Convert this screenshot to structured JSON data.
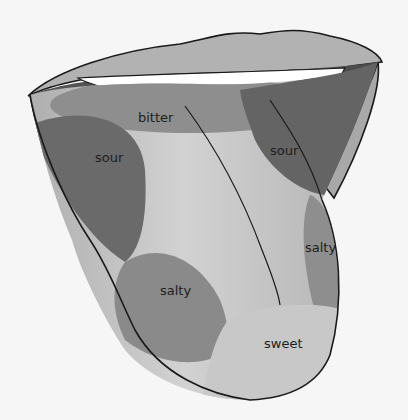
{
  "diagram": {
    "regions": [
      {
        "id": "bitter",
        "label": "bitter",
        "x": 160,
        "y": 118
      },
      {
        "id": "sour-left",
        "label": "sour",
        "x": 115,
        "y": 158
      },
      {
        "id": "sour-right",
        "label": "sour",
        "x": 284,
        "y": 155
      },
      {
        "id": "salty-right",
        "label": "salty",
        "x": 325,
        "y": 248
      },
      {
        "id": "salty-left",
        "label": "salty",
        "x": 180,
        "y": 292
      },
      {
        "id": "sweet",
        "label": "sweet",
        "x": 283,
        "y": 345
      }
    ],
    "colors": {
      "background": "#f6f6f6",
      "outline": "#1a1a1a",
      "lip": "#b0b0b0",
      "teeth": "#ffffff",
      "mouth_dark": "#5a5a5a",
      "tongue_base": "#b8b8b8",
      "tongue_highlight": "#d4d4d4",
      "bitter_zone": "#8e8e8e",
      "sour_zone": "#6a6a6a",
      "salty_zone": "#8a8a8a",
      "sweet_zone": "#c6c6c6"
    }
  }
}
